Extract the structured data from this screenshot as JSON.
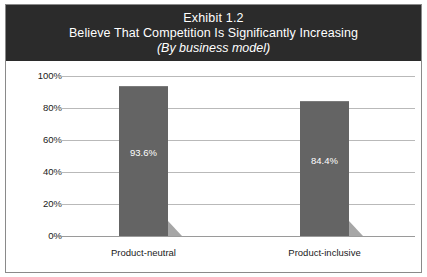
{
  "exhibit": {
    "title_line1": "Exhibit 1.2",
    "title_line2": "Believe That Competition Is Significantly Increasing",
    "title_line3": "(By business model)"
  },
  "colors": {
    "header_background": "#2b2b2b",
    "header_text": "#ffffff",
    "bar_fill": "#646464",
    "bar_shadow": "#a6a6a6",
    "gridline": "#b9b9b9",
    "frame_border": "#8a8a8a",
    "plot_background": "#ffffff"
  },
  "chart_data": {
    "type": "bar",
    "title": "Exhibit 1.2 Believe That Competition Is Significantly Increasing (By business model)",
    "subtitle": "(By business model)",
    "categories": [
      "Product-neutral",
      "Product-inclusive"
    ],
    "values": [
      93.6,
      84.4
    ],
    "value_labels": [
      "93.6%",
      "84.4%"
    ],
    "xlabel": "",
    "ylabel": "",
    "ylim": [
      0,
      100
    ],
    "yticks": [
      100,
      80,
      60,
      40,
      20,
      0
    ],
    "ytick_labels": [
      "100%",
      "80%",
      "60%",
      "40%",
      "20%",
      "0%"
    ],
    "grid": true,
    "legend": "none",
    "series": [
      {
        "name": "Percent believing competition is significantly increasing",
        "values": [
          93.6,
          84.4
        ]
      }
    ]
  }
}
